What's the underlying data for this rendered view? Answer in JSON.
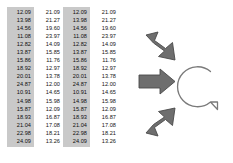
{
  "diagram": {
    "background_color": "#ffffff",
    "arrow_color": "#6e6e6e",
    "arrow_stroke_color": "#4a4a4a",
    "highlight_color": "#c9c9c9",
    "bubble_stroke_color": "#7a7a7a",
    "text_color": "#141414"
  },
  "tables": [
    {
      "name": "data-table-left",
      "columns": [
        {
          "name": "column-highlighted",
          "highlighted": true,
          "values": [
            "12.09",
            "13.98",
            "14.56",
            "11.08",
            "12.82",
            "13.87",
            "15.86",
            "18.92",
            "20.01",
            "24.87",
            "10.91",
            "14.98",
            "15.87",
            "18.93",
            "21.04",
            "22.98",
            "24.09"
          ]
        },
        {
          "name": "column-plain",
          "highlighted": false,
          "values": [
            "21.09",
            "21.27",
            "19.60",
            "23.97",
            "14.09",
            "15.85",
            "11.76",
            "12.97",
            "13.78",
            "12.00",
            "14.65",
            "15.98",
            "12.09",
            "16.87",
            "17.08",
            "18.21",
            "13.26"
          ]
        }
      ]
    },
    {
      "name": "data-table-right",
      "columns": [
        {
          "name": "column-highlighted",
          "highlighted": true,
          "values": [
            "12.09",
            "13.98",
            "14.56",
            "11.08",
            "12.82",
            "13.87",
            "15.86",
            "18.92",
            "20.01",
            "24.87",
            "10.91",
            "14.98",
            "15.87",
            "18.93",
            "21.04",
            "22.98",
            "24.09"
          ]
        },
        {
          "name": "column-plain",
          "highlighted": false,
          "values": [
            "21.09",
            "21.27",
            "19.60",
            "23.97",
            "14.09",
            "15.85",
            "11.76",
            "12.97",
            "13.78",
            "12.00",
            "14.65",
            "15.98",
            "12.09",
            "16.87",
            "17.08",
            "18.21",
            "13.26"
          ]
        }
      ]
    }
  ],
  "flow": {
    "arrows": [
      {
        "name": "arrow-down-right",
        "icon": "arrow-diagonal-down-right-icon",
        "direction": "down-right"
      },
      {
        "name": "arrow-right",
        "icon": "arrow-right-icon",
        "direction": "right"
      },
      {
        "name": "arrow-up-right",
        "icon": "arrow-diagonal-up-right-icon",
        "direction": "up-right"
      }
    ],
    "target": {
      "name": "speech-bubble",
      "icon": "speech-bubble-icon",
      "label": ""
    }
  }
}
